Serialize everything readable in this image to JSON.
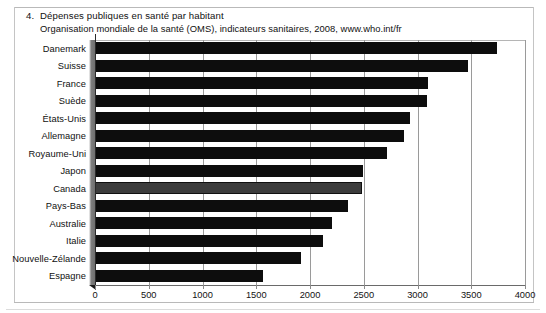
{
  "figure": {
    "number": "4.",
    "title": "Dépenses publiques en santé par habitant",
    "source": "Organisation mondiale de la santé (OMS), indicateurs sanitaires, 2008, www.who.int/fr"
  },
  "chart_data": {
    "type": "bar",
    "orientation": "horizontal",
    "title": "Dépenses publiques en santé par habitant",
    "subtitle": "Organisation mondiale de la santé (OMS), indicateurs sanitaires, 2008, www.who.int/fr",
    "xlabel": "",
    "ylabel": "",
    "xlim": [
      0,
      4000
    ],
    "xticks": [
      0,
      500,
      1000,
      1500,
      2000,
      2500,
      3000,
      3500,
      4000
    ],
    "xtick_labels": [
      "0",
      "500",
      "1000",
      "1500",
      "2000",
      "2500",
      "3000",
      "3500",
      "4000"
    ],
    "grid": "vertical",
    "legend": "none",
    "categories": [
      "Danemark",
      "Suisse",
      "France",
      "Suède",
      "États-Unis",
      "Allemagne",
      "Royaume-Uni",
      "Japon",
      "Canada",
      "Pays-Bas",
      "Australie",
      "Italie",
      "Nouvelle-Zélande",
      "Espagne"
    ],
    "values": [
      3740,
      3470,
      3100,
      3090,
      2930,
      2870,
      2715,
      2490,
      2480,
      2350,
      2200,
      2120,
      1920,
      1560
    ],
    "highlight_category": "Canada",
    "colors": {
      "bar": "#0d0d0d",
      "bar_highlight": "#3c3c3c",
      "grid": "#9a9a9a",
      "axis": "#2a2a2a",
      "background": "#ffffff"
    }
  }
}
